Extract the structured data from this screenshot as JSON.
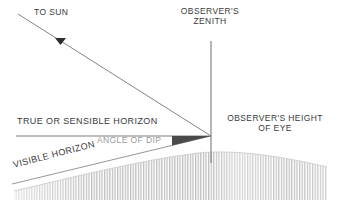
{
  "figure": {
    "background_color": "#ffffff",
    "line_color": "#555555",
    "text_color": "#3a3a3a",
    "muted_text_color": "#9a9a9a",
    "wedge_color": "#4a4a4a",
    "earth_hatch_color": "#bcbcbc"
  },
  "labels": {
    "to_sun": "TO SUN",
    "observers_zenith_line1": "OBSERVER'S",
    "observers_zenith_line2": "ZENITH",
    "true_or_sensible_horizon": "TRUE OR SENSIBLE HORIZON",
    "angle_of_dip": "ANGLE OF DIP",
    "observers_height_line1": "OBSERVER'S HEIGHT",
    "observers_height_line2": "OF EYE",
    "visible_horizon": "VISIBLE HORIZON"
  },
  "geometry": {
    "observer_eye": {
      "x": 211,
      "y": 136
    },
    "zenith_line": {
      "x": 211,
      "y_top": 41,
      "y_bottom": 163
    },
    "sun_ray": {
      "x1": 18,
      "y1": 14,
      "x2": 211,
      "y2": 136
    },
    "sun_arrow": {
      "x": 60,
      "y": 41
    },
    "true_horizon_line": {
      "x1": 16,
      "y1": 136,
      "x2": 211,
      "y2": 136
    },
    "visible_horizon_line": {
      "x1": 12,
      "y1": 183,
      "x2": 211,
      "y2": 136
    },
    "dip_wedge": {
      "x_start": 172,
      "x_end": 211,
      "y_top": 136,
      "y_bottom": 145
    },
    "earth_top_curve": {
      "left_y": 190,
      "peak_x": 235,
      "peak_y": 152,
      "right_y": 166
    },
    "earth_bottom_y": 200,
    "earth_left_x": 14,
    "earth_right_x": 327
  },
  "icons": {
    "sun_direction_arrow": "arrow-triangle-down"
  }
}
